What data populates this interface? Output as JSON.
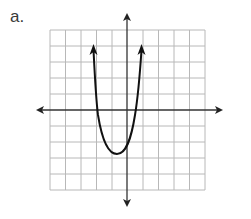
{
  "problem": {
    "label": "a."
  },
  "graph": {
    "type": "coordinate-plane",
    "grid": {
      "columns": 10,
      "rows": 10,
      "x_range": [
        -5,
        5
      ],
      "y_range": [
        -5,
        5
      ],
      "grid_color": "#b5b5b5"
    },
    "axes": {
      "x_axis": "arrows both ends",
      "y_axis": "arrows both ends",
      "color": "#333333"
    },
    "curve": {
      "kind": "parabola",
      "opens": "up",
      "vertex_approx": [
        -0.7,
        -2.75
      ],
      "x_intercepts_approx": [
        -2,
        0.5
      ],
      "end_arrows": "up",
      "color": "#111111"
    }
  }
}
